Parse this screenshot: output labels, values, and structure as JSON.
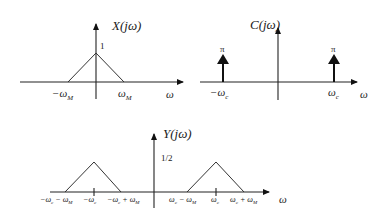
{
  "diagram": {
    "panels": [
      {
        "id": "x",
        "title": "X(jω)",
        "peak_label": "1",
        "x_axis_label": "ω",
        "tick_labels": [
          "−ω",
          "ω"
        ],
        "tick_subscripts": [
          "M",
          "M"
        ],
        "shape": "triangle",
        "points": [
          [
            "-ω_M",
            0
          ],
          [
            0,
            1
          ],
          [
            "ω_M",
            0
          ]
        ]
      },
      {
        "id": "c",
        "title": "C(jω)",
        "impulse_label": "π",
        "x_axis_label": "ω",
        "tick_labels": [
          "−ω",
          "ω"
        ],
        "tick_subscripts": [
          "c",
          "c"
        ],
        "shape": "impulses",
        "impulses": [
          {
            "at": "-ω_c",
            "area": "π"
          },
          {
            "at": "ω_c",
            "area": "π"
          }
        ]
      },
      {
        "id": "y",
        "title": "Y(jω)",
        "peak_label": "1/2",
        "x_axis_label": "ω",
        "left_ticks": {
          "a": "−ω",
          "a_sub": "c",
          "a2": " − ω",
          "a2_sub": "M",
          "b": "−ω",
          "b_sub": "c",
          "c": "−ω",
          "c_sub": "c",
          "c2": " + ω",
          "c2_sub": "M"
        },
        "right_ticks": {
          "a": "ω",
          "a_sub": "c",
          "a2": " − ω",
          "a2_sub": "M",
          "b": "ω",
          "b_sub": "c",
          "c": "ω",
          "c_sub": "c",
          "c2": " + ω",
          "c2_sub": "M"
        },
        "shape": "two triangles",
        "triangles": [
          {
            "center": "-ω_c",
            "left": "-ω_c-ω_M",
            "right": "-ω_c+ω_M",
            "height": "1/2"
          },
          {
            "center": "ω_c",
            "left": "ω_c-ω_M",
            "right": "ω_c+ω_M",
            "height": "1/2"
          }
        ]
      }
    ]
  }
}
